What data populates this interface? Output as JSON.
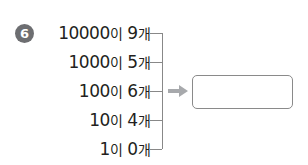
{
  "problem": {
    "number": "6",
    "rows": [
      {
        "base": "10000",
        "particle": "이",
        "count": "9",
        "unit": "개"
      },
      {
        "base": "1000",
        "particle": "이",
        "count": "5",
        "unit": "개"
      },
      {
        "base": "100",
        "particle": "이",
        "count": "6",
        "unit": "개"
      },
      {
        "base": "10",
        "particle": "이",
        "count": "4",
        "unit": "개"
      },
      {
        "base": "1",
        "particle": "이",
        "count": "0",
        "unit": "개"
      }
    ],
    "answer": ""
  },
  "colors": {
    "badge": "#6d6e71",
    "arrow": "#a7a9ac",
    "lines": "#888888"
  }
}
